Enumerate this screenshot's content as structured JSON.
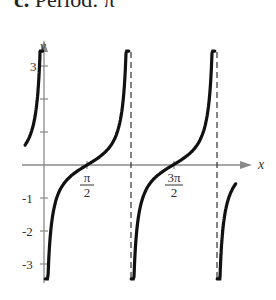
{
  "header": {
    "prefix": "c.",
    "label": "Period: π"
  },
  "chart_data": {
    "type": "line",
    "title": "c. Period: π",
    "function": "y = -½·cot(x)",
    "xlabel": "x",
    "ylabel": "y",
    "x_tick_labels": [
      {
        "num": "π",
        "den": "2",
        "value": 1.5708
      },
      {
        "num": "3π",
        "den": "2",
        "value": 4.7124
      }
    ],
    "y_tick_labels": [
      "3",
      "-1",
      "-2",
      "-3"
    ],
    "y_ticks": [
      3,
      2,
      1,
      -1,
      -2,
      -3
    ],
    "asymptotes": [
      "π",
      "2π"
    ],
    "xlim": [
      -0.9,
      7.5
    ],
    "ylim": [
      -3.4,
      3.8
    ],
    "grid": false,
    "series": [
      {
        "name": "branch-left",
        "x_range": [
          -0.69,
          -0.05
        ]
      },
      {
        "name": "branch-1",
        "x_range": [
          0.05,
          3.0
        ]
      },
      {
        "name": "branch-2",
        "x_range": [
          3.2,
          6.1
        ]
      },
      {
        "name": "branch-right",
        "x_range": [
          6.33,
          7.0
        ]
      }
    ],
    "colors": {
      "curve": "#111111",
      "axis": "#8a8a8a",
      "asymptote": "#333333"
    }
  }
}
